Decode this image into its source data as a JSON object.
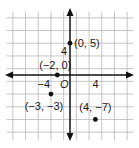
{
  "header": {
    "cutoff_text": ""
  },
  "chart_data": {
    "type": "scatter",
    "title": "",
    "xlabel": "",
    "ylabel": "",
    "grid": true,
    "grid_step": 2,
    "xlim": [
      -10,
      10
    ],
    "ylim": [
      -10,
      10
    ],
    "origin_label": "O",
    "tick_labels": [
      {
        "axis": "x",
        "value": -4,
        "label": "−4"
      },
      {
        "axis": "x",
        "value": 4,
        "label": "4"
      },
      {
        "axis": "y",
        "value": 4,
        "label": "4"
      }
    ],
    "points": [
      {
        "x": 0,
        "y": 5,
        "label": "(0, 5)"
      },
      {
        "x": -2,
        "y": 0,
        "label": "(−2, 0)"
      },
      {
        "x": -3,
        "y": -3,
        "label": "(−3, −3)"
      },
      {
        "x": 4,
        "y": -7,
        "label": "(4, −7)"
      }
    ],
    "colors": {
      "grid": "#b8b8b8",
      "axis": "#111111",
      "point": "#111111",
      "text": "#1a1a1a"
    }
  }
}
